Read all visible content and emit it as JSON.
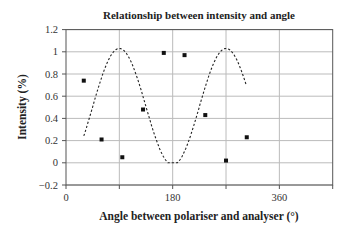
{
  "chart_data": {
    "type": "scatter",
    "title": "Relationship between intensity and angle",
    "xlabel": "Angle between polariser and analyser (°)",
    "ylabel": "Intensity (%)",
    "xlim": [
      0,
      450
    ],
    "ylim": [
      -0.2,
      1.2
    ],
    "x_ticks": [
      0,
      180,
      360
    ],
    "x_gridlines": [
      90,
      180,
      270,
      360
    ],
    "y_ticks": [
      -0.2,
      0,
      0.2,
      0.4,
      0.6,
      0.8,
      1,
      1.2
    ],
    "y_tick_labels": [
      "−0.2",
      "0",
      "0.2",
      "0.4",
      "0.6",
      "0.8",
      "1",
      "1.2"
    ],
    "grid": true,
    "legend": null,
    "series": [
      {
        "name": "Measured intensity",
        "style": "markers",
        "x": [
          30,
          60,
          95,
          130,
          165,
          200,
          235,
          270,
          305
        ],
        "y": [
          0.74,
          0.21,
          0.05,
          0.48,
          0.99,
          0.97,
          0.43,
          0.02,
          0.23
        ]
      },
      {
        "name": "Fitted curve",
        "style": "dashed-line",
        "description": "cos²-shaped fit, peak ≈1.05 at 180°, minima ≈0 at 90° and 270°",
        "x_range": [
          30,
          305
        ]
      }
    ]
  },
  "labels": {
    "title": "Relationship between intensity and angle",
    "xlabel": "Angle between polariser and analyser (°)",
    "ylabel": "Intensity (%)"
  }
}
